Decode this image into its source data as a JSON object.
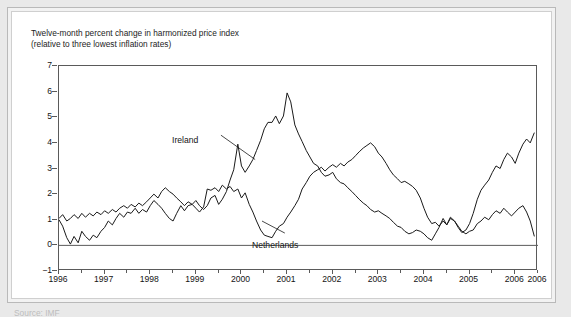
{
  "figure": {
    "caption_line1": "Twelve-month percent change in harmonized price index",
    "caption_line2": "(relative to three lowest inflation rates)",
    "footnote_partial": "Source: IMF"
  },
  "colors": {
    "line": "#1a1a1a",
    "axis": "#5a5a5a",
    "page_background": "#e9e9e9",
    "plot_background": "#ffffff",
    "text": "#141414"
  },
  "chart_data": {
    "type": "line",
    "title": "Twelve-month percent change in harmonized price index (relative to three lowest inflation rates)",
    "xlabel": "",
    "ylabel": "",
    "ylim": [
      -1,
      7
    ],
    "xlim": [
      1996,
      2006.5
    ],
    "yticks": [
      -1,
      0,
      1,
      2,
      3,
      4,
      5,
      6,
      7
    ],
    "ytick_labels": [
      "−1",
      "0",
      "1",
      "2",
      "3",
      "4",
      "5",
      "6",
      "7"
    ],
    "xticks": [
      1996,
      1997,
      1998,
      1999,
      2000,
      2001,
      2002,
      2003,
      2004,
      2005,
      2006,
      2006.5
    ],
    "xtick_labels": [
      "1996",
      "1997",
      "1998",
      "1999",
      "2000",
      "2001",
      "2002",
      "2003",
      "2004",
      "2005",
      "2006",
      "2006"
    ],
    "xtick_minor_interval": 0.5,
    "grid": false,
    "zero_reference_line": 0,
    "legend_position": "inline-annotations",
    "annotations": [
      {
        "text": "Ireland",
        "series": "Ireland"
      },
      {
        "text": "Netherlands",
        "series": "Netherlands"
      }
    ],
    "series": [
      {
        "name": "Ireland",
        "x": [
          1996.0,
          1996.08,
          1996.17,
          1996.25,
          1996.33,
          1996.42,
          1996.5,
          1996.58,
          1996.67,
          1996.75,
          1996.83,
          1996.92,
          1997.0,
          1997.08,
          1997.17,
          1997.25,
          1997.33,
          1997.42,
          1997.5,
          1997.58,
          1997.67,
          1997.75,
          1997.83,
          1997.92,
          1998.0,
          1998.08,
          1998.17,
          1998.25,
          1998.33,
          1998.42,
          1998.5,
          1998.58,
          1998.67,
          1998.75,
          1998.83,
          1998.92,
          1999.0,
          1999.08,
          1999.17,
          1999.25,
          1999.33,
          1999.42,
          1999.5,
          1999.58,
          1999.67,
          1999.75,
          1999.83,
          1999.92,
          2000.0,
          2000.08,
          2000.17,
          2000.25,
          2000.33,
          2000.42,
          2000.5,
          2000.58,
          2000.67,
          2000.75,
          2000.83,
          2000.92,
          2001.0,
          2001.08,
          2001.17,
          2001.25,
          2001.33,
          2001.42,
          2001.5,
          2001.58,
          2001.67,
          2001.75,
          2001.83,
          2001.92,
          2002.0,
          2002.08,
          2002.17,
          2002.25,
          2002.33,
          2002.42,
          2002.5,
          2002.58,
          2002.67,
          2002.75,
          2002.83,
          2002.92,
          2003.0,
          2003.08,
          2003.17,
          2003.25,
          2003.33,
          2003.42,
          2003.5,
          2003.58,
          2003.67,
          2003.75,
          2003.83,
          2003.92,
          2004.0,
          2004.08,
          2004.17,
          2004.25,
          2004.33,
          2004.42,
          2004.5,
          2004.58,
          2004.67,
          2004.75,
          2004.83,
          2004.92,
          2005.0,
          2005.08,
          2005.17,
          2005.25,
          2005.33,
          2005.42,
          2005.5,
          2005.58,
          2005.67,
          2005.75,
          2005.83,
          2005.92,
          2006.0,
          2006.08,
          2006.17,
          2006.25,
          2006.33,
          2006.42
        ],
        "values": [
          1.0,
          0.75,
          0.3,
          0.05,
          0.35,
          0.1,
          0.55,
          0.35,
          0.2,
          0.4,
          0.3,
          0.55,
          0.7,
          0.95,
          0.8,
          1.05,
          1.25,
          1.1,
          1.3,
          1.25,
          1.45,
          1.25,
          1.4,
          1.3,
          1.55,
          1.75,
          1.6,
          1.45,
          1.25,
          1.05,
          0.95,
          1.25,
          1.55,
          1.35,
          1.55,
          1.6,
          1.75,
          1.55,
          1.4,
          1.55,
          1.85,
          1.95,
          1.6,
          1.8,
          2.1,
          2.55,
          2.95,
          3.95,
          3.1,
          2.85,
          3.1,
          3.35,
          3.7,
          4.1,
          4.55,
          4.8,
          4.8,
          5.05,
          4.75,
          5.05,
          5.95,
          5.6,
          4.7,
          4.35,
          4.05,
          3.7,
          3.45,
          3.2,
          3.1,
          2.85,
          2.7,
          2.75,
          2.85,
          2.6,
          2.45,
          2.4,
          2.25,
          2.1,
          1.95,
          1.8,
          1.65,
          1.55,
          1.4,
          1.3,
          1.35,
          1.25,
          1.15,
          1.05,
          0.9,
          0.75,
          0.7,
          0.55,
          0.45,
          0.5,
          0.6,
          0.55,
          0.45,
          0.3,
          0.2,
          0.45,
          0.7,
          1.05,
          0.8,
          1.05,
          0.95,
          0.75,
          0.55,
          0.45,
          0.55,
          0.6,
          0.85,
          0.95,
          1.1,
          1.0,
          1.2,
          1.35,
          1.25,
          1.45,
          1.3,
          1.15,
          1.3,
          1.45,
          1.55,
          1.3,
          0.95,
          0.35
        ],
        "start_value": 1.0,
        "peak_value": 5.95,
        "peak_x": 2001.0,
        "end_value": 0.35
      },
      {
        "name": "Netherlands",
        "x": [
          1996.0,
          1996.08,
          1996.17,
          1996.25,
          1996.33,
          1996.42,
          1996.5,
          1996.58,
          1996.67,
          1996.75,
          1996.83,
          1996.92,
          1997.0,
          1997.08,
          1997.17,
          1997.25,
          1997.33,
          1997.42,
          1997.5,
          1997.58,
          1997.67,
          1997.75,
          1997.83,
          1997.92,
          1998.0,
          1998.08,
          1998.17,
          1998.25,
          1998.33,
          1998.42,
          1998.5,
          1998.58,
          1998.67,
          1998.75,
          1998.83,
          1998.92,
          1999.0,
          1999.08,
          1999.17,
          1999.25,
          1999.33,
          1999.42,
          1999.5,
          1999.58,
          1999.67,
          1999.75,
          1999.83,
          1999.92,
          2000.0,
          2000.08,
          2000.17,
          2000.25,
          2000.33,
          2000.42,
          2000.5,
          2000.58,
          2000.67,
          2000.75,
          2000.83,
          2000.92,
          2001.0,
          2001.08,
          2001.17,
          2001.25,
          2001.33,
          2001.42,
          2001.5,
          2001.58,
          2001.67,
          2001.75,
          2001.83,
          2001.92,
          2002.0,
          2002.08,
          2002.17,
          2002.25,
          2002.33,
          2002.42,
          2002.5,
          2002.58,
          2002.67,
          2002.75,
          2002.83,
          2002.92,
          2003.0,
          2003.08,
          2003.17,
          2003.25,
          2003.33,
          2003.42,
          2003.5,
          2003.58,
          2003.67,
          2003.75,
          2003.83,
          2003.92,
          2004.0,
          2004.08,
          2004.17,
          2004.25,
          2004.33,
          2004.42,
          2004.5,
          2004.58,
          2004.67,
          2004.75,
          2004.83,
          2004.92,
          2005.0,
          2005.08,
          2005.17,
          2005.25,
          2005.33,
          2005.42,
          2005.5,
          2005.58,
          2005.67,
          2005.75,
          2005.83,
          2005.92,
          2006.0,
          2006.08,
          2006.17,
          2006.25,
          2006.33,
          2006.42
        ],
        "values": [
          1.05,
          1.2,
          0.95,
          1.05,
          1.2,
          1.05,
          1.25,
          1.1,
          1.25,
          1.15,
          1.3,
          1.2,
          1.35,
          1.25,
          1.4,
          1.3,
          1.45,
          1.55,
          1.45,
          1.6,
          1.5,
          1.65,
          1.55,
          1.7,
          1.85,
          2.0,
          1.85,
          2.1,
          2.25,
          2.1,
          2.0,
          1.85,
          1.7,
          1.55,
          1.7,
          1.6,
          1.45,
          1.3,
          1.5,
          2.2,
          2.15,
          2.25,
          2.1,
          2.35,
          2.2,
          2.3,
          2.1,
          2.2,
          1.85,
          2.05,
          1.6,
          1.3,
          0.95,
          0.6,
          0.4,
          0.35,
          0.3,
          0.55,
          0.75,
          0.85,
          1.1,
          1.3,
          1.55,
          1.8,
          2.2,
          2.45,
          2.7,
          2.85,
          2.95,
          3.05,
          2.9,
          3.05,
          3.15,
          3.05,
          3.2,
          3.1,
          3.25,
          3.35,
          3.5,
          3.65,
          3.8,
          3.9,
          4.0,
          3.85,
          3.6,
          3.45,
          3.2,
          2.95,
          2.75,
          2.6,
          2.45,
          2.5,
          2.4,
          2.3,
          2.15,
          1.85,
          1.45,
          1.1,
          0.85,
          0.9,
          0.75,
          0.95,
          0.8,
          1.1,
          0.95,
          0.7,
          0.5,
          0.6,
          0.85,
          1.25,
          1.8,
          2.15,
          2.35,
          2.55,
          2.85,
          3.1,
          3.0,
          3.35,
          3.6,
          3.45,
          3.2,
          3.6,
          3.95,
          4.15,
          4.0,
          4.4
        ],
        "start_value": 1.05,
        "trough_value": 0.3,
        "trough_x": 2000.67,
        "peak_value": 4.4,
        "end_value": 4.4
      }
    ]
  }
}
